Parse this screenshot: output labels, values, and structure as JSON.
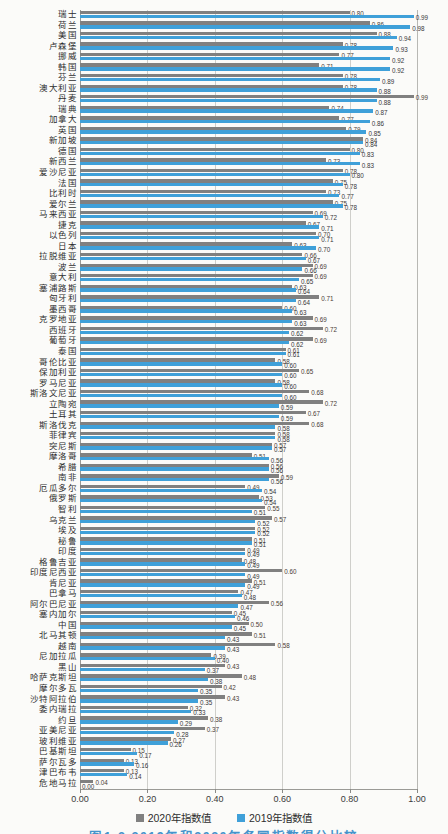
{
  "legend": {
    "item_2020": "2020年指数值",
    "item_2019": "2019年指数值"
  },
  "caption": "图1-2 2019年和2020年各国指数得分比较",
  "colors": {
    "bar_2020": "#808080",
    "bar_2019": "#3FA0D9",
    "gridline": "#cfcfcb",
    "caption_blue": "#4593cb"
  },
  "chart_data": {
    "type": "bar",
    "orientation": "horizontal",
    "title": "",
    "xlabel": "",
    "ylabel": "",
    "xlim": [
      0,
      1
    ],
    "x_ticks": [
      "0.00",
      "0.20",
      "0.40",
      "0.60",
      "0.80",
      "1.00"
    ],
    "grid": "vertical",
    "legend_position": "bottom",
    "series_order_top_to_bottom_per_category": [
      "2020年指数值",
      "2019年指数值"
    ],
    "categories": [
      "瑞士",
      "荷兰",
      "美国",
      "卢森堡",
      "挪威",
      "韩国",
      "芬兰",
      "澳大利亚",
      "丹麦",
      "瑞典",
      "加拿大",
      "英国",
      "新加坡",
      "德国",
      "新西兰",
      "爱沙尼亚",
      "法国",
      "比利时",
      "爱尔兰",
      "马来西亚",
      "捷克",
      "以色列",
      "日本",
      "拉脱维亚",
      "波兰",
      "意大利",
      "塞浦路斯",
      "匈牙利",
      "墨西哥",
      "克罗地亚",
      "西班牙",
      "葡萄牙",
      "泰国",
      "哥伦比亚",
      "保加利亚",
      "罗马尼亚",
      "斯洛文尼亚",
      "立陶宛",
      "土耳其",
      "斯洛伐克",
      "菲律宾",
      "突尼斯",
      "摩洛哥",
      "希腊",
      "南非",
      "厄瓜多尔",
      "俄罗斯",
      "智利",
      "乌克兰",
      "埃及",
      "秘鲁",
      "印度",
      "格鲁吉亚",
      "印度尼西亚",
      "肯尼亚",
      "巴拿马",
      "阿尔巴尼亚",
      "塞内加尔",
      "中国",
      "北马其顿",
      "越南",
      "尼加拉瓜",
      "黑山",
      "哈萨克斯坦",
      "摩尔多瓦",
      "沙特阿拉伯",
      "委内瑞拉",
      "约旦",
      "亚美尼亚",
      "玻利维亚",
      "巴基斯坦",
      "萨尔瓦多",
      "津巴布韦",
      "危地马拉"
    ],
    "series": [
      {
        "name": "2020年指数值",
        "color": "#808080",
        "values": [
          0.8,
          0.86,
          0.88,
          0.78,
          0.77,
          0.71,
          0.78,
          0.78,
          0.99,
          0.74,
          0.77,
          0.79,
          0.84,
          0.8,
          0.73,
          0.78,
          0.75,
          0.73,
          0.75,
          0.69,
          0.67,
          0.7,
          0.63,
          0.66,
          0.69,
          0.69,
          0.63,
          0.71,
          0.6,
          0.69,
          0.72,
          0.69,
          0.61,
          0.58,
          0.65,
          0.58,
          0.68,
          0.72,
          0.67,
          0.68,
          0.58,
          0.57,
          0.51,
          0.56,
          0.59,
          0.49,
          0.53,
          0.55,
          0.57,
          0.52,
          0.51,
          0.49,
          0.48,
          0.6,
          0.51,
          0.47,
          0.56,
          0.45,
          0.5,
          0.51,
          0.58,
          0.39,
          0.43,
          0.48,
          0.42,
          0.43,
          0.32,
          0.38,
          0.37,
          0.27,
          0.15,
          0.13,
          0.13,
          0.04
        ]
      },
      {
        "name": "2019年指数值",
        "color": "#3FA0D9",
        "values": [
          0.99,
          0.98,
          0.94,
          0.93,
          0.92,
          0.92,
          0.89,
          0.88,
          0.88,
          0.87,
          0.86,
          0.85,
          0.84,
          0.83,
          0.83,
          0.8,
          0.78,
          0.77,
          0.78,
          0.72,
          0.71,
          0.71,
          0.7,
          0.67,
          0.66,
          0.65,
          0.64,
          0.64,
          0.63,
          0.63,
          0.62,
          0.62,
          0.61,
          0.6,
          0.6,
          0.6,
          0.6,
          0.59,
          0.59,
          0.58,
          0.58,
          0.57,
          0.56,
          0.56,
          0.56,
          0.54,
          0.54,
          0.51,
          0.52,
          0.52,
          0.51,
          0.49,
          0.49,
          0.49,
          0.49,
          0.48,
          0.47,
          0.46,
          0.45,
          0.43,
          0.43,
          0.4,
          0.37,
          0.38,
          0.35,
          0.35,
          0.33,
          0.29,
          0.28,
          0.26,
          0.17,
          0.16,
          0.14,
          0.0
        ]
      }
    ]
  }
}
